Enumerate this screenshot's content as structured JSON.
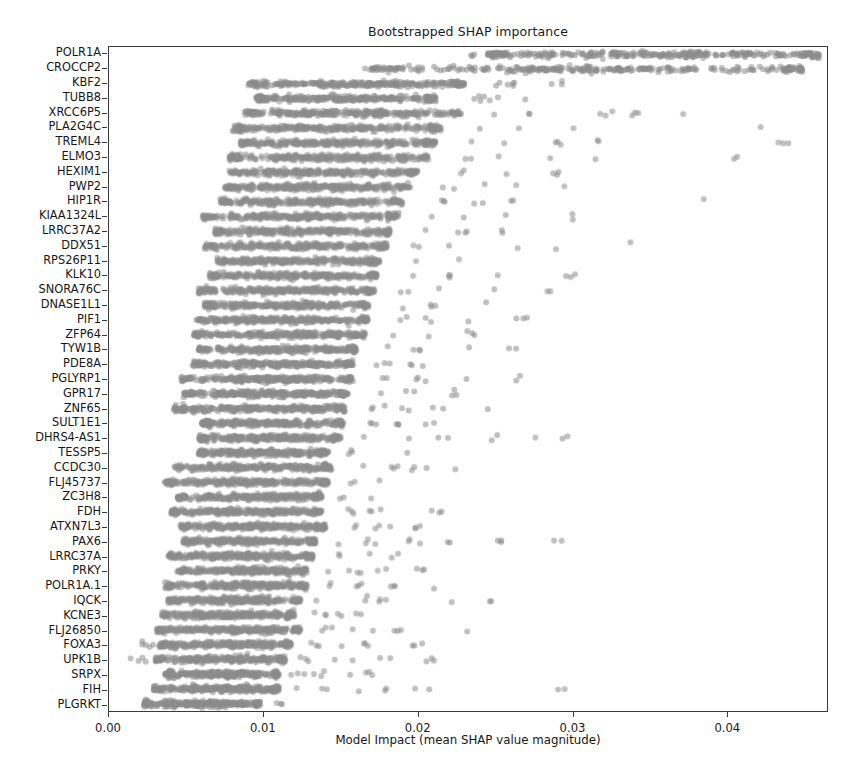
{
  "chart_data": {
    "type": "scatter",
    "title": "Bootstrapped SHAP importance",
    "xlabel": "Model Impact (mean SHAP value magnitude)",
    "ylabel": "",
    "xlim": [
      0.0,
      0.0465
    ],
    "xticks": [
      0.0,
      0.01,
      0.02,
      0.03,
      0.04
    ],
    "xtick_labels": [
      "0.00",
      "0.01",
      "0.02",
      "0.03",
      "0.04"
    ],
    "grid": false,
    "legend": null,
    "point_color": "#8c8c8c",
    "point_opacity": 0.55,
    "point_size": 3.0,
    "n_bootstrap_points_per_row": 300,
    "categories": [
      "POLR1A",
      "CROCCP2",
      "KBF2",
      "TUBB8",
      "XRCC6P5",
      "PLA2G4C",
      "TREML4",
      "ELMO3",
      "HEXIM1",
      "PWP2",
      "HIP1R",
      "KIAA1324L",
      "LRRC37A2",
      "DDX51",
      "RPS26P11",
      "KLK10",
      "SNORA76C",
      "DNASE1L1",
      "PIF1",
      "ZFP64",
      "TYW1B",
      "PDE8A",
      "PGLYRP1",
      "GPR17",
      "ZNF65",
      "SULT1E1",
      "DHRS4-AS1",
      "TESSP5",
      "CCDC30",
      "FLJ45737",
      "ZC3H8",
      "FDH",
      "ATXN7L3",
      "PAX6",
      "LRRC37A",
      "PRKY",
      "POLR1A.1",
      "IQCK",
      "KCNE3",
      "FLJ26850",
      "FOXA3",
      "UPK1B",
      "SRPX",
      "FIH",
      "PLGRKT"
    ],
    "series": [
      {
        "name": "bootstrap distribution",
        "rows": [
          {
            "category": "POLR1A",
            "low": 0.0245,
            "q1": 0.03,
            "median": 0.0355,
            "q3": 0.0405,
            "high": 0.046,
            "outliers": [
              0.0235
            ]
          },
          {
            "category": "CROCCP2",
            "low": 0.017,
            "q1": 0.0255,
            "median": 0.032,
            "q3": 0.0385,
            "high": 0.045,
            "outliers": [
              0.0165,
              0.0178
            ]
          },
          {
            "category": "KBF2",
            "low": 0.009,
            "q1": 0.013,
            "median": 0.016,
            "q3": 0.0195,
            "high": 0.023,
            "outliers": [
              0.0252,
              0.0262,
              0.029
            ]
          },
          {
            "category": "TUBB8",
            "low": 0.0095,
            "q1": 0.0125,
            "median": 0.0152,
            "q3": 0.018,
            "high": 0.0212,
            "outliers": [
              0.024,
              0.0248,
              0.0268
            ]
          },
          {
            "category": "XRCC6P5",
            "low": 0.0088,
            "q1": 0.012,
            "median": 0.0148,
            "q3": 0.0182,
            "high": 0.0228,
            "outliers": [
              0.0252,
              0.0275,
              0.032,
              0.034,
              0.0372
            ]
          },
          {
            "category": "PLA2G4C",
            "low": 0.008,
            "q1": 0.0115,
            "median": 0.0145,
            "q3": 0.0178,
            "high": 0.0215,
            "outliers": [
              0.0238,
              0.0262,
              0.03,
              0.042
            ]
          },
          {
            "category": "TREML4",
            "low": 0.0085,
            "q1": 0.0115,
            "median": 0.0142,
            "q3": 0.0172,
            "high": 0.0212,
            "outliers": [
              0.0238,
              0.0258,
              0.029,
              0.0315,
              0.0438
            ]
          },
          {
            "category": "ELMO3",
            "low": 0.0078,
            "q1": 0.011,
            "median": 0.014,
            "q3": 0.017,
            "high": 0.0208,
            "outliers": [
              0.0232,
              0.0256,
              0.0282,
              0.0316,
              0.0408
            ]
          },
          {
            "category": "HEXIM1",
            "low": 0.0078,
            "q1": 0.0108,
            "median": 0.0135,
            "q3": 0.0165,
            "high": 0.02,
            "outliers": [
              0.0228,
              0.0252,
              0.0292
            ]
          },
          {
            "category": "PWP2",
            "low": 0.0075,
            "q1": 0.0105,
            "median": 0.0132,
            "q3": 0.016,
            "high": 0.0195,
            "outliers": [
              0.0218,
              0.024,
              0.0268,
              0.0296
            ]
          },
          {
            "category": "HIP1R",
            "low": 0.0072,
            "q1": 0.0102,
            "median": 0.013,
            "q3": 0.0158,
            "high": 0.019,
            "outliers": [
              0.0215,
              0.0238,
              0.0265,
              0.0385
            ]
          },
          {
            "category": "KIAA1324L",
            "low": 0.006,
            "q1": 0.0098,
            "median": 0.0126,
            "q3": 0.0155,
            "high": 0.0188,
            "outliers": [
              0.0208,
              0.0232,
              0.026,
              0.03
            ]
          },
          {
            "category": "LRRC37A2",
            "low": 0.0068,
            "q1": 0.0098,
            "median": 0.0124,
            "q3": 0.0152,
            "high": 0.0182,
            "outliers": [
              0.0205,
              0.0228,
              0.0255
            ]
          },
          {
            "category": "DDX51",
            "low": 0.0062,
            "q1": 0.0095,
            "median": 0.0122,
            "q3": 0.015,
            "high": 0.018,
            "outliers": [
              0.02,
              0.0222,
              0.0258,
              0.029,
              0.0338
            ]
          },
          {
            "category": "RPS26P11",
            "low": 0.007,
            "q1": 0.0096,
            "median": 0.012,
            "q3": 0.0146,
            "high": 0.0175,
            "outliers": [
              0.0198,
              0.0228
            ]
          },
          {
            "category": "KLK10",
            "low": 0.0065,
            "q1": 0.0094,
            "median": 0.0119,
            "q3": 0.0145,
            "high": 0.0174,
            "outliers": [
              0.0196,
              0.0222,
              0.0256,
              0.03
            ]
          },
          {
            "category": "SNORA76C",
            "low": 0.0058,
            "q1": 0.0092,
            "median": 0.0118,
            "q3": 0.0144,
            "high": 0.0172,
            "outliers": [
              0.0192,
              0.0215,
              0.0248,
              0.0285
            ]
          },
          {
            "category": "DNASE1L1",
            "low": 0.0062,
            "q1": 0.009,
            "median": 0.0115,
            "q3": 0.014,
            "high": 0.0168,
            "outliers": [
              0.019,
              0.0212,
              0.024
            ]
          },
          {
            "category": "PIF1",
            "low": 0.0056,
            "q1": 0.0088,
            "median": 0.0114,
            "q3": 0.014,
            "high": 0.0168,
            "outliers": [
              0.0188,
              0.0208,
              0.0232,
              0.0268
            ]
          },
          {
            "category": "ZFP64",
            "low": 0.0055,
            "q1": 0.0086,
            "median": 0.0112,
            "q3": 0.0138,
            "high": 0.0166,
            "outliers": [
              0.0185,
              0.0206,
              0.0236
            ]
          },
          {
            "category": "TYW1B",
            "low": 0.0058,
            "q1": 0.0086,
            "median": 0.011,
            "q3": 0.0134,
            "high": 0.016,
            "outliers": [
              0.018,
              0.02,
              0.0228,
              0.0262
            ]
          },
          {
            "category": "PDE8A",
            "low": 0.0054,
            "q1": 0.0084,
            "median": 0.0108,
            "q3": 0.0133,
            "high": 0.0158,
            "outliers": [
              0.0178,
              0.0198
            ]
          },
          {
            "category": "PGLYRP1",
            "low": 0.0046,
            "q1": 0.008,
            "median": 0.0105,
            "q3": 0.013,
            "high": 0.0158,
            "outliers": [
              0.0178,
              0.02,
              0.023,
              0.0265
            ]
          },
          {
            "category": "GPR17",
            "low": 0.0048,
            "q1": 0.008,
            "median": 0.0104,
            "q3": 0.0128,
            "high": 0.0155,
            "outliers": [
              0.0175,
              0.0195,
              0.0222
            ]
          },
          {
            "category": "ZNF65",
            "low": 0.0042,
            "q1": 0.0076,
            "median": 0.0102,
            "q3": 0.0127,
            "high": 0.0153,
            "outliers": [
              0.0172,
              0.0192,
              0.0214,
              0.0244
            ]
          },
          {
            "category": "SULT1E1",
            "low": 0.006,
            "q1": 0.0082,
            "median": 0.0104,
            "q3": 0.0127,
            "high": 0.0152,
            "outliers": [
              0.017,
              0.0188,
              0.0208
            ]
          },
          {
            "category": "DHRS4-AS1",
            "low": 0.0058,
            "q1": 0.008,
            "median": 0.0102,
            "q3": 0.0125,
            "high": 0.015,
            "outliers": [
              0.0168,
              0.019,
              0.0216,
              0.0248,
              0.0275,
              0.0296
            ]
          },
          {
            "category": "TESSP5",
            "low": 0.0058,
            "q1": 0.008,
            "median": 0.01,
            "q3": 0.012,
            "high": 0.0142,
            "outliers": [
              0.0158,
              0.0196
            ]
          },
          {
            "category": "CCDC30",
            "low": 0.0042,
            "q1": 0.0072,
            "median": 0.0096,
            "q3": 0.012,
            "high": 0.0144,
            "outliers": [
              0.0162,
              0.0186,
              0.02,
              0.0225
            ]
          },
          {
            "category": "FLJ45737",
            "low": 0.0036,
            "q1": 0.007,
            "median": 0.0094,
            "q3": 0.0118,
            "high": 0.0142,
            "outliers": [
              0.0158,
              0.0176
            ]
          },
          {
            "category": "ZC3H8",
            "low": 0.0044,
            "q1": 0.007,
            "median": 0.0092,
            "q3": 0.0115,
            "high": 0.0138,
            "outliers": [
              0.0152,
              0.0166
            ]
          },
          {
            "category": "FDH",
            "low": 0.004,
            "q1": 0.0068,
            "median": 0.009,
            "q3": 0.0114,
            "high": 0.0138,
            "outliers": [
              0.0156,
              0.0172,
              0.0214
            ]
          },
          {
            "category": "ATXN7L3",
            "low": 0.0046,
            "q1": 0.007,
            "median": 0.0092,
            "q3": 0.0116,
            "high": 0.014,
            "outliers": [
              0.0158,
              0.0178,
              0.02
            ]
          },
          {
            "category": "PAX6",
            "low": 0.0048,
            "q1": 0.007,
            "median": 0.009,
            "q3": 0.0112,
            "high": 0.0134,
            "outliers": [
              0.015,
              0.0172,
              0.0196,
              0.0218,
              0.0252,
              0.0288
            ]
          },
          {
            "category": "LRRC37A",
            "low": 0.0038,
            "q1": 0.0066,
            "median": 0.0088,
            "q3": 0.011,
            "high": 0.0132,
            "outliers": [
              0.0148,
              0.0168,
              0.0186
            ]
          },
          {
            "category": "PRKY",
            "low": 0.0044,
            "q1": 0.0068,
            "median": 0.0088,
            "q3": 0.0108,
            "high": 0.0128,
            "outliers": [
              0.0142,
              0.0158,
              0.0178,
              0.02
            ]
          },
          {
            "category": "POLR1A.1",
            "low": 0.0036,
            "q1": 0.0062,
            "median": 0.0084,
            "q3": 0.0106,
            "high": 0.0128,
            "outliers": [
              0.0144,
              0.0162,
              0.0182,
              0.021
            ]
          },
          {
            "category": "IQCK",
            "low": 0.0038,
            "q1": 0.0064,
            "median": 0.0084,
            "q3": 0.0104,
            "high": 0.0124,
            "outliers": [
              0.0138,
              0.0168,
              0.0176,
              0.0222,
              0.0248
            ]
          },
          {
            "category": "KCNE3",
            "low": 0.0034,
            "q1": 0.006,
            "median": 0.008,
            "q3": 0.01,
            "high": 0.012,
            "outliers": [
              0.0136,
              0.015,
              0.016
            ]
          },
          {
            "category": "FLJ26850",
            "low": 0.003,
            "q1": 0.0058,
            "median": 0.008,
            "q3": 0.0102,
            "high": 0.0124,
            "outliers": [
              0.014,
              0.0156,
              0.0172,
              0.0188,
              0.0228
            ]
          },
          {
            "category": "FOXA3",
            "low": 0.0032,
            "q1": 0.0058,
            "median": 0.0078,
            "q3": 0.0098,
            "high": 0.0118,
            "outliers": [
              0.0134,
              0.0152,
              0.0168,
              0.0196,
              0.0022,
              0.0026
            ]
          },
          {
            "category": "UPK1B",
            "low": 0.003,
            "q1": 0.0054,
            "median": 0.0074,
            "q3": 0.0094,
            "high": 0.0114,
            "outliers": [
              0.0128,
              0.0146,
              0.016,
              0.0178,
              0.0206,
              0.0018,
              0.0024
            ]
          },
          {
            "category": "SRPX",
            "low": 0.0036,
            "q1": 0.0056,
            "median": 0.0074,
            "q3": 0.0092,
            "high": 0.011,
            "outliers": [
              0.0124,
              0.0138,
              0.0152,
              0.0172
            ]
          },
          {
            "category": "FIH",
            "low": 0.0028,
            "q1": 0.005,
            "median": 0.007,
            "q3": 0.009,
            "high": 0.011,
            "outliers": [
              0.0124,
              0.014,
              0.0158,
              0.0176,
              0.0204,
              0.0298
            ]
          },
          {
            "category": "PLGRKT",
            "low": 0.0022,
            "q1": 0.0044,
            "median": 0.0062,
            "q3": 0.008,
            "high": 0.0098,
            "outliers": [
              0.0112
            ]
          }
        ]
      }
    ]
  }
}
